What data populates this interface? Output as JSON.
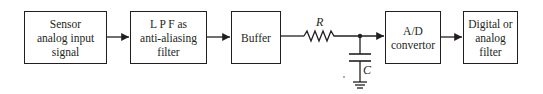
{
  "diagram": {
    "blocks": [
      {
        "id": "sensor",
        "lines": [
          "Sensor",
          "analog input",
          "signal"
        ]
      },
      {
        "id": "lpf",
        "lines": [
          "L P F as",
          "anti-aliasing",
          "filter"
        ]
      },
      {
        "id": "buffer",
        "lines": [
          "Buffer"
        ]
      },
      {
        "id": "adc",
        "lines": [
          "A/D",
          "convertor"
        ]
      },
      {
        "id": "filter",
        "lines": [
          "Digital or",
          "analog",
          "filter"
        ]
      }
    ],
    "components": {
      "resistor_label": "R",
      "capacitor_label": "C"
    },
    "connections": [
      {
        "from": "sensor",
        "to": "lpf",
        "type": "arrow"
      },
      {
        "from": "lpf",
        "to": "buffer",
        "type": "arrow"
      },
      {
        "from": "buffer",
        "to": "resistor",
        "type": "line"
      },
      {
        "from": "resistor",
        "to": "adc",
        "type": "arrow",
        "via": "junction"
      },
      {
        "from": "junction",
        "to": "capacitor",
        "type": "line"
      },
      {
        "from": "capacitor",
        "to": "ground",
        "type": "line"
      },
      {
        "from": "adc",
        "to": "filter",
        "type": "arrow"
      }
    ],
    "colors": {
      "stroke": "#231f20",
      "background": "#ffffff"
    }
  }
}
